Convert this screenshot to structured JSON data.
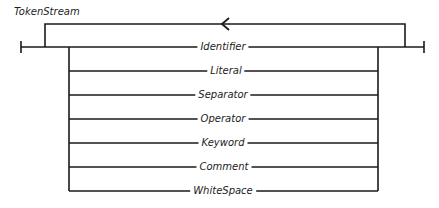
{
  "diagram": {
    "title": "TokenStream",
    "type": "railroad-syntax-diagram",
    "line_color": "#1a1a1a",
    "loop_direction": "left",
    "alternatives": [
      {
        "label": "Identifier"
      },
      {
        "label": "Literal"
      },
      {
        "label": "Separator"
      },
      {
        "label": "Operator"
      },
      {
        "label": "Keyword"
      },
      {
        "label": "Comment"
      },
      {
        "label": "WhiteSpace"
      }
    ]
  }
}
